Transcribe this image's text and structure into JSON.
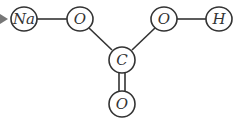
{
  "diagram": {
    "title": "",
    "molecule": "sodium bicarbonate structure",
    "colors": {
      "line": "#333333",
      "background": "#ffffff",
      "arrow": "#777777"
    },
    "atoms": [
      {
        "id": "na",
        "label": "Na",
        "x": 24,
        "y": 19
      },
      {
        "id": "o1",
        "label": "O",
        "x": 80,
        "y": 19
      },
      {
        "id": "o2",
        "label": "O",
        "x": 164,
        "y": 19
      },
      {
        "id": "h",
        "label": "H",
        "x": 219,
        "y": 19
      },
      {
        "id": "c",
        "label": "C",
        "x": 122,
        "y": 60
      },
      {
        "id": "o3",
        "label": "O",
        "x": 122,
        "y": 104
      }
    ],
    "bonds": [
      {
        "from": "na",
        "to": "o1",
        "order": 1
      },
      {
        "from": "o2",
        "to": "h",
        "order": 1
      },
      {
        "from": "o1",
        "to": "c",
        "order": 1
      },
      {
        "from": "o2",
        "to": "c",
        "order": 1
      },
      {
        "from": "c",
        "to": "o3",
        "order": 2
      }
    ]
  }
}
